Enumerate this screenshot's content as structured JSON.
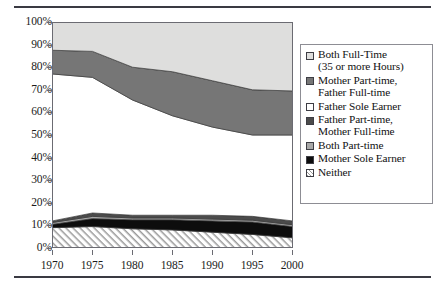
{
  "chart_data": {
    "type": "area",
    "title": "",
    "subtitle": "",
    "xlabel": "",
    "ylabel": "",
    "stacked": true,
    "percent_stacked": true,
    "grid": false,
    "legend_position": "right",
    "x": [
      1970,
      1975,
      1980,
      1985,
      1990,
      1995,
      2000
    ],
    "xtick_labels": [
      "1970",
      "1975",
      "1980",
      "1985",
      "1990",
      "1995",
      "2000"
    ],
    "ytick_labels": [
      "100%",
      "90%",
      "80%",
      "70%",
      "60%",
      "50%",
      "40%",
      "30%",
      "20%",
      "10%",
      "0%"
    ],
    "ylim": [
      0,
      100
    ],
    "xlim": [
      1970,
      2000
    ],
    "ytick_step": 10,
    "series": [
      {
        "name": "Neither",
        "color": "#ffffff",
        "pattern": "hatch",
        "values": [
          9,
          9.5,
          8.5,
          8,
          7,
          6,
          4.5
        ]
      },
      {
        "name": "Mother Sole Earner",
        "color": "#0d0d0d",
        "pattern": "solid",
        "values": [
          1.5,
          3.5,
          4,
          4.5,
          5,
          5.5,
          5
        ]
      },
      {
        "name": "Both Part-time",
        "color": "#a8a8a8",
        "pattern": "solid",
        "values": [
          0.8,
          1,
          0.8,
          0.8,
          0.8,
          0.8,
          0.8
        ]
      },
      {
        "name": "Father Part-time, Mother Full-time",
        "color": "#4b4b4b",
        "pattern": "solid",
        "values": [
          0.7,
          1.5,
          1.2,
          1.2,
          1.7,
          1.7,
          1.7
        ]
      },
      {
        "name": "Father Sole Earner",
        "color": "#ffffff",
        "pattern": "solid",
        "values": [
          65,
          60,
          51,
          44,
          39,
          36,
          38
        ]
      },
      {
        "name": "Mother Part-time, Father Full-time",
        "color": "#767676",
        "pattern": "solid",
        "values": [
          10.5,
          11.5,
          14.5,
          19.5,
          20.5,
          20,
          19.5
        ]
      },
      {
        "name": "Both Full-Time (35 or more Hours)",
        "color": "#dededd",
        "pattern": "solid",
        "values": [
          12.5,
          13,
          20,
          22,
          26,
          30,
          30.5
        ]
      }
    ]
  },
  "legend": {
    "items": [
      {
        "label": "Both Full-Time\n(35 or more Hours)",
        "swatch": "sw-both-ft",
        "name": "both-full-time"
      },
      {
        "label": "Mother Part-time,\nFather Full-time",
        "swatch": "sw-mpt-fft",
        "name": "mother-part-time-father-full-time"
      },
      {
        "label": "Father Sole Earner",
        "swatch": "sw-father-sole",
        "name": "father-sole-earner"
      },
      {
        "label": "Father Part-time,\nMother Full-time",
        "swatch": "sw-fpt-mft",
        "name": "father-part-time-mother-full-time"
      },
      {
        "label": "Both Part-time",
        "swatch": "sw-both-pt",
        "name": "both-part-time"
      },
      {
        "label": "Mother Sole Earner",
        "swatch": "sw-mother-sole",
        "name": "mother-sole-earner"
      },
      {
        "label": "Neither",
        "swatch": "sw-neither",
        "name": "neither"
      }
    ]
  },
  "colors": {
    "both_full_time": "#dededd",
    "mother_part_time_father_full_time": "#767676",
    "father_sole_earner": "#ffffff",
    "father_part_time_mother_full_time": "#4b4b4b",
    "both_part_time": "#a8a8a8",
    "mother_sole_earner": "#0d0d0d",
    "neither_hatch": "#9a9a9a",
    "rule": "#3a3a42",
    "axis": "#6b6b72",
    "legend_border": "#8d8d94"
  }
}
